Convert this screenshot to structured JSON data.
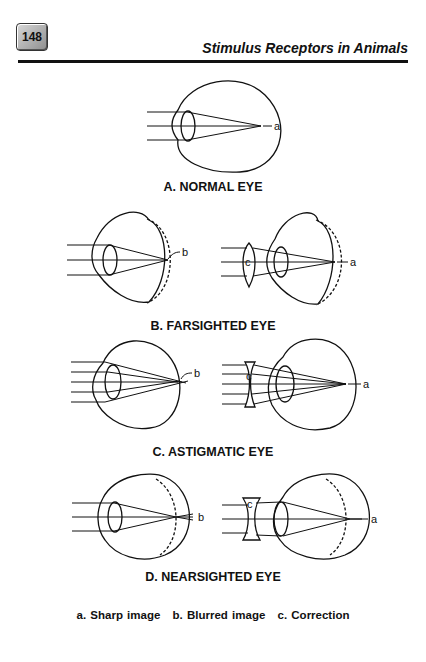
{
  "header": {
    "page_number": "148",
    "running_title": "Stimulus Receptors in Animals"
  },
  "figures": {
    "normal": {
      "caption": "A.  NORMAL EYE",
      "labels": {
        "focus": "a"
      }
    },
    "farsighted": {
      "caption": "B.  FARSIGHTED EYE",
      "labels": {
        "uncorrected": "b",
        "lens": "c",
        "corrected": "a"
      }
    },
    "astigmatic": {
      "caption": "C.  ASTIGMATIC EYE",
      "labels": {
        "uncorrected": "b",
        "lens": "c",
        "corrected": "a"
      }
    },
    "nearsighted": {
      "caption": "D.  NEARSIGHTED EYE",
      "labels": {
        "uncorrected": "b",
        "lens": "c",
        "corrected": "a"
      }
    }
  },
  "legend": [
    "a.  Sharp image",
    "b.  Blurred image",
    "c.  Correction"
  ]
}
